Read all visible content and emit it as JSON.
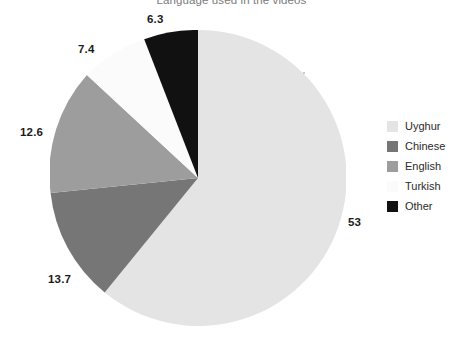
{
  "chart_data": {
    "type": "pie",
    "title": "Language used in the videos",
    "categories": [
      "Uyghur",
      "Chinese",
      "English",
      "Turkish",
      "Other"
    ],
    "values": [
      53,
      13.7,
      12.6,
      7.4,
      6.3
    ],
    "labels": [
      "53",
      "13.7",
      "12.6",
      "7.4",
      "6.3"
    ],
    "colors": [
      "#e4e4e4",
      "#767676",
      "#9d9d9d",
      "#fbfbfb",
      "#111111"
    ],
    "start_angle_deg": 0,
    "direction": "clockwise",
    "legend_position": "right",
    "grid": false,
    "xlabel": "",
    "ylabel": ""
  },
  "chart": {
    "title": "Language used in the videos",
    "slices": [
      {
        "name": "Uyghur",
        "label": "53",
        "value": 53,
        "color": "#e4e4e4",
        "path": "M 148 148 L 148 0 A 148 148 0 1 1 54.7 262.4 Z"
      },
      {
        "name": "Chinese",
        "label": "13.7",
        "value": 13.7,
        "color": "#767676",
        "path": "M 148 148 L 54.7 262.4 A 148 148 0 0 1 0.6 162.9 Z"
      },
      {
        "name": "English",
        "label": "12.6",
        "value": 12.6,
        "color": "#9d9d9d",
        "path": "M 148 148 L 0.6 162.9 A 148 148 0 0 1 36.9 44.9 Z"
      },
      {
        "name": "Turkish",
        "label": "7.4",
        "value": 7.4,
        "color": "#fbfbfb",
        "path": "M 148 148 L 36.9 44.9 A 148 148 0 0 1 94.2 9.2 Z"
      },
      {
        "name": "Other",
        "label": "6.3",
        "value": 6.3,
        "color": "#111111",
        "path": "M 148 148 L 94.2 9.2 A 148 148 0 0 1 148 0 Z"
      }
    ],
    "data_labels": [
      {
        "name": "uyghur",
        "text": "53",
        "left": 348,
        "top": 216
      },
      {
        "name": "chinese",
        "text": "13.7",
        "left": 48,
        "top": 273
      },
      {
        "name": "english",
        "text": "12.6",
        "left": 20,
        "top": 126
      },
      {
        "name": "turkish",
        "text": "7.4",
        "left": 78,
        "top": 43
      },
      {
        "name": "other",
        "text": "6.3",
        "left": 147,
        "top": 13
      }
    ]
  },
  "legend": {
    "items": [
      {
        "label": "Uyghur",
        "color": "#e4e4e4"
      },
      {
        "label": "Chinese",
        "color": "#767676"
      },
      {
        "label": "English",
        "color": "#9d9d9d"
      },
      {
        "label": "Turkish",
        "color": "#fbfbfb"
      },
      {
        "label": "Other",
        "color": "#111111"
      }
    ]
  }
}
